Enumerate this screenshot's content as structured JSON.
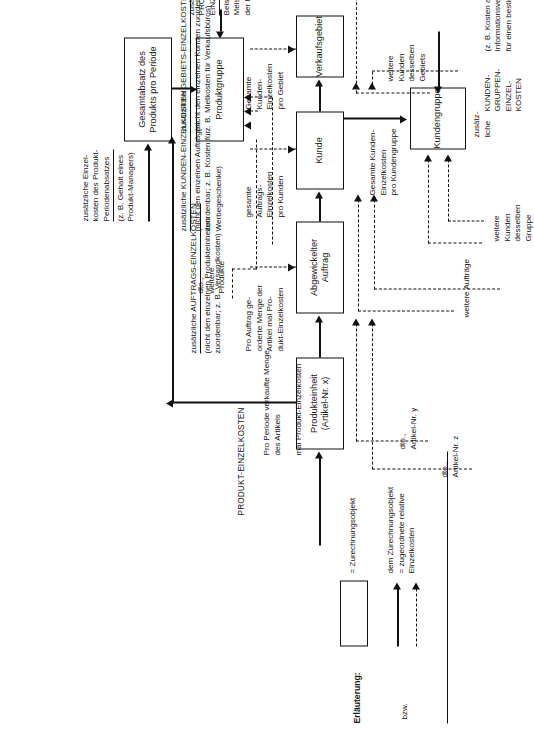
{
  "diagram": {
    "legend": {
      "heading": "Erläuterung:",
      "box_meaning": "= Zurechnungsobjekt",
      "bzw_label": "bzw.",
      "arrow_meaning": "dem Zurechnungsobjekt\n= zugeordnete relative\nEinzelkosten"
    },
    "nodes": [
      {
        "id": "produkteinheit",
        "label": "Produkteinheit\n(Artikel-Nr. x)"
      },
      {
        "id": "abgewickelter-auftrag",
        "label": "Abgewickelter\nAuftrag"
      },
      {
        "id": "kunde",
        "label": "Kunde"
      },
      {
        "id": "verkaufsgebiet",
        "label": "Verkaufsgebiet"
      },
      {
        "id": "kundengruppe",
        "label": "Kundengruppe"
      },
      {
        "id": "gesamtabsatz",
        "label": "Gesamtabsatz des\nProdukts pro Periode"
      },
      {
        "id": "produktgruppe",
        "label": "Produktgruppe"
      }
    ],
    "labels": {
      "produkt_einzelkosten_header": "PRODUKT-EINZELKOSTEN",
      "pro_auftrag": "Pro Auftrag ge-\norderte Menge der\nArtikel mal Pro-\ndukt-Einzelkosten",
      "pro_periode": "Pro Periode verkaufte Menge\ndes Artikels\n\nmal Produkt-Einzelkosten",
      "dto_y": "dto.,\nArtikel-Nr. y",
      "dto_z": "dto.,\nArtikel-Nr. z",
      "dto_weitere_produkte": "dto.,\nweitere\nProdukte",
      "weitere_auftraege": "weitere Aufträge",
      "gesamte_auftrags": "gesamte\nAuftrags-\nEinzelkosten\npro Kunden",
      "gesamte_kunden_gebiet": "Gesamte\nKunden-\nEinzelkosten\npro Gebiet",
      "gesamte_kunden_gruppe": "Gesamte Kunden-\nEinzelkosten\npro Kundengruppe",
      "weitere_kunden_gebiet": "weitere\nKunden\ndesselben\nGebiets",
      "weitere_kunden_gruppe": "weitere\nKunden\ndesselben\nGruppe",
      "zusaetzlich_liche": "zusätz-\nliche"
    },
    "cost_annotations": [
      {
        "id": "produkt-perioden",
        "title": "zusätzliche Einzel-\nkosten des Produkt-\nPeriodenabsatzes",
        "example": "(z. B. Gehalt eines\nProdukt-Managers)"
      },
      {
        "id": "produktgruppen",
        "title": "zusätzliche\nPRODUKTGRUPPEN-\nEINZELKOSTEN,",
        "example": "Beispiel: u. U.\nMeistergehalt in\nder Fertigung"
      },
      {
        "id": "auftrags",
        "title": "zusätzliche AUFTRAGS-EINZELKOSTEN",
        "example": "(nicht den einzelnen Produkteinheiten\nzuordenbar; z. B. Versandkosten)"
      },
      {
        "id": "kunden",
        "title": "zusätzliche KUNDEN-EINZELKOSTEN",
        "example": "(nicht den einzelnen Aufträgen\nzuordenbar; z. B. Kosten für\nWerbegeschenke)"
      },
      {
        "id": "gebiets",
        "title": "zusätzliche GEBIETS-EINZELKOSTEN",
        "example": "(nicht den einzelnen Kunden zuordenbar;\nz. B. Mietkosten für Verkaufsbüros)"
      },
      {
        "id": "kundengruppen",
        "title": "KUNDEN-\nGRUPPEN-\nEINZEL-\nKOSTEN",
        "example": "(z. B. Kosten anwendungstechnischer\nInformationsveranstaltungen\nfür einen bestimmten Verwenderkreis)"
      }
    ],
    "colors": {
      "ink": "#111111",
      "paper": "#ffffff"
    }
  }
}
